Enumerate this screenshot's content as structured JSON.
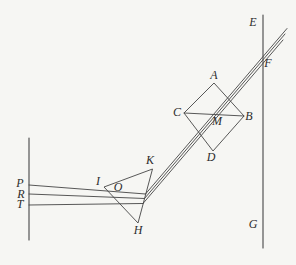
{
  "figure_type": "optics-ray-diagram",
  "colors": {
    "background": "#f6f6f3",
    "line": "#454545",
    "label": "#2d2d2d"
  },
  "point_labels": {
    "E": "E",
    "F": "F",
    "G": "G",
    "A": "A",
    "B": "B",
    "C": "C",
    "D": "D",
    "M": "M",
    "K": "K",
    "I": "I",
    "O": "O",
    "H": "H",
    "P": "P",
    "R": "R",
    "T": "T"
  },
  "geometry": {
    "stroke_width": 0.9,
    "polygons": [
      {
        "name": "prism-triangle-IKH",
        "points": "104,187 152.5,169 138,223"
      },
      {
        "name": "prism-square-ABDC",
        "points": "214,83 244,116 213,151 184,113"
      }
    ],
    "segments": [
      {
        "name": "left-screen-line",
        "x1": 29,
        "y1": 138,
        "x2": 29,
        "y2": 240,
        "w": 1.1
      },
      {
        "name": "right-screen-line",
        "x1": 263,
        "y1": 15,
        "x2": 263,
        "y2": 248,
        "w": 1.1
      },
      {
        "name": "square-diagonal-CB",
        "x1": 184,
        "y1": 113,
        "x2": 244,
        "y2": 116
      },
      {
        "name": "incident-ray-P",
        "x1": 29,
        "y1": 185,
        "x2": 145.5,
        "y2": 194
      },
      {
        "name": "incident-ray-R",
        "x1": 29,
        "y1": 194,
        "x2": 144.5,
        "y2": 198.5
      },
      {
        "name": "incident-ray-T",
        "x1": 29,
        "y1": 205,
        "x2": 143,
        "y2": 203.5
      },
      {
        "name": "refracted-ray-P",
        "x1": 145.5,
        "y1": 194,
        "x2": 287,
        "y2": 28.5
      },
      {
        "name": "refracted-ray-R",
        "x1": 144.5,
        "y1": 198.5,
        "x2": 285,
        "y2": 34
      },
      {
        "name": "refracted-ray-T",
        "x1": 143,
        "y1": 203.5,
        "x2": 283,
        "y2": 40
      }
    ]
  }
}
